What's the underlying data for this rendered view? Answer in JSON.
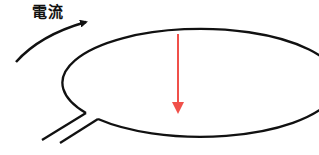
{
  "diagram": {
    "current_label": "電流",
    "colors": {
      "wire": "#111111",
      "field_arrow": "#f0504a",
      "background": "#ffffff"
    },
    "elements": [
      {
        "id": "wire-loop",
        "type": "ellipse"
      },
      {
        "id": "current-direction-arrow",
        "type": "curved-arrow"
      },
      {
        "id": "field-arrow",
        "type": "arrow",
        "direction": "down"
      },
      {
        "id": "lead-wires",
        "type": "parallel-lines"
      }
    ]
  }
}
